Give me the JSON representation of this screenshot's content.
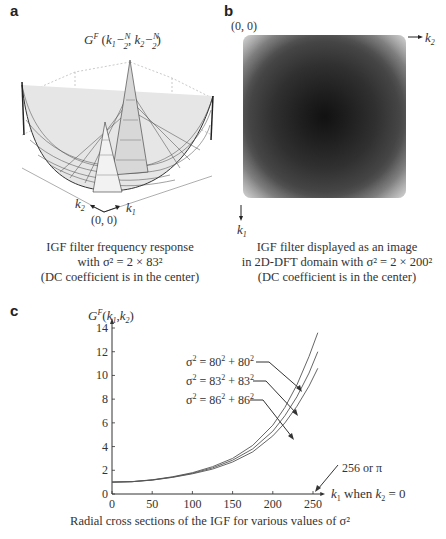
{
  "panels": {
    "a": {
      "label": "a",
      "plot_title": "G^F(k1 − N/2, k2 − N/2)",
      "axis_k1": "k1",
      "axis_k2": "k2",
      "origin": "(0, 0)",
      "caption_lines": [
        "IGF filter frequency response",
        "with σ² = 2 × 83²",
        "(DC coefficient is in the center)"
      ]
    },
    "b": {
      "label": "b",
      "origin": "(0, 0)",
      "axis_k2": "k2",
      "axis_k1": "k1",
      "caption_lines": [
        "IGF filter displayed as an image",
        "in 2D-DFT domain with σ² = 2 × 200²",
        "(DC coefficient is in the center)"
      ]
    },
    "c": {
      "label": "c",
      "ylabel": "G^F(k1,k2)",
      "xlabel": "k1 when k2 = 0",
      "end_annotation": "256 or π",
      "caption": "Radial cross sections of the IGF for various values of σ²"
    }
  },
  "chart_data": [
    {
      "panel": "c",
      "type": "line",
      "title": "Radial cross sections of the IGF for various values of σ²",
      "xlabel": "k1 when k2 = 0",
      "ylabel": "G^F(k1,k2)",
      "xlim": [
        0,
        256
      ],
      "ylim": [
        0,
        14
      ],
      "xticks": [
        0,
        50,
        100,
        150,
        200,
        250
      ],
      "yticks": [
        0,
        2,
        4,
        6,
        8,
        10,
        12,
        14
      ],
      "grid": false,
      "annotations": [
        "256 or π"
      ],
      "x": [
        0,
        25,
        50,
        75,
        100,
        125,
        150,
        175,
        200,
        215,
        230,
        245,
        256
      ],
      "series": [
        {
          "name": "σ² = 80² + 80²",
          "values": [
            1.0,
            1.05,
            1.2,
            1.45,
            1.8,
            2.3,
            3.0,
            4.1,
            5.8,
            7.3,
            9.2,
            11.6,
            13.6
          ]
        },
        {
          "name": "σ² = 83² + 83²",
          "values": [
            1.0,
            1.04,
            1.18,
            1.42,
            1.75,
            2.2,
            2.85,
            3.8,
            5.3,
            6.6,
            8.2,
            10.2,
            12.0
          ]
        },
        {
          "name": "σ² = 86² + 86²",
          "values": [
            1.0,
            1.04,
            1.17,
            1.4,
            1.7,
            2.1,
            2.7,
            3.55,
            4.9,
            6.0,
            7.4,
            9.1,
            10.6
          ]
        }
      ]
    }
  ]
}
